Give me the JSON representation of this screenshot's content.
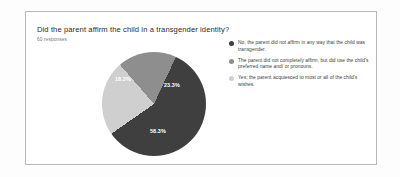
{
  "card": {
    "question": "Did the parent affirm the child in a transgender identity?",
    "responses": "60 responses"
  },
  "chart_data": {
    "type": "pie",
    "title": "Did the parent affirm the child in a transgender identity?",
    "subtitle": "60 responses",
    "total_responses": 60,
    "legend_position": "right",
    "grid": false,
    "categories": [
      "No, the parent did not affirm in any way that the child was transgender.",
      "The parent did not completely affirm, but did use the child's preferred name and/ or pronouns.",
      "Yes; the parent acquiesced to most or all of the child's wishes."
    ],
    "values": [
      58.3,
      23.3,
      18.3
    ],
    "value_labels": [
      "58.3%",
      "23.3%",
      "18.3%"
    ],
    "colors": [
      "#3f3f3f",
      "#cfcfcf",
      "#8e8e8e"
    ]
  },
  "legend": [
    {
      "color": "#3f3f3f",
      "label": "No, the parent did not affirm in any way that the child was transgender."
    },
    {
      "color": "#8e8e8e",
      "label": "The parent did not completely affirm, but did use the child's preferred name and/ or pronouns."
    },
    {
      "color": "#cfcfcf",
      "label": "Yes; the parent acquiesced to most or all of the child's wishes."
    }
  ]
}
